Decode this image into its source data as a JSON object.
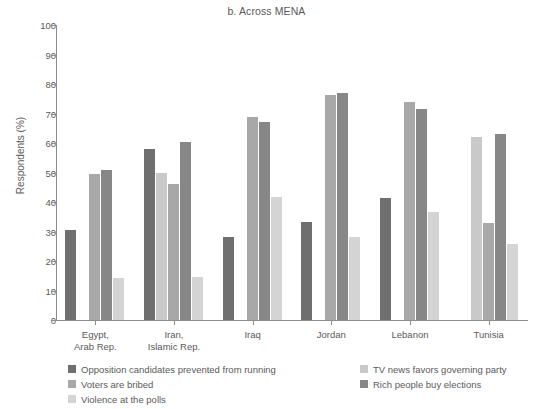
{
  "chart_data": {
    "type": "bar",
    "title": "b. Across MENA",
    "xlabel": "",
    "ylabel": "Respondents (%)",
    "ylim": [
      0,
      100
    ],
    "ytick_step": 10,
    "yticks": [
      0,
      10,
      20,
      30,
      40,
      50,
      60,
      70,
      80,
      90,
      100
    ],
    "grid": false,
    "legend_position": "bottom",
    "categories": [
      "Egypt, Arab Rep.",
      "Iran, Islamic Rep.",
      "Iraq",
      "Jordan",
      "Lebanon",
      "Tunisia"
    ],
    "category_lines": [
      [
        "Egypt,",
        "Arab Rep."
      ],
      [
        "Iran,",
        "Islamic Rep."
      ],
      [
        "Iraq",
        ""
      ],
      [
        "Jordan",
        ""
      ],
      [
        "Lebanon",
        ""
      ],
      [
        "Tunisia",
        ""
      ]
    ],
    "series": [
      {
        "name": "Opposition candidates prevented from running",
        "color": "#6f6f6f",
        "values": [
          30.4,
          58.0,
          28.0,
          33.2,
          41.4,
          null
        ]
      },
      {
        "name": "TV news favors governing party",
        "color": "#c9c9c9",
        "values": [
          null,
          49.8,
          null,
          null,
          null,
          62.0
        ]
      },
      {
        "name": "Voters are bribed",
        "color": "#a8a8a8",
        "values": [
          49.5,
          46.0,
          68.8,
          76.2,
          74.0,
          33.0
        ]
      },
      {
        "name": "Rich people buy elections",
        "color": "#878787",
        "values": [
          50.8,
          60.2,
          67.0,
          77.0,
          71.5,
          63.2
        ]
      },
      {
        "name": "Violence at the polls",
        "color": "#d4d4d4",
        "values": [
          14.4,
          14.6,
          41.7,
          28.0,
          36.5,
          25.8
        ]
      }
    ]
  },
  "legend": {
    "left_column": [
      {
        "label": "Opposition candidates prevented from running",
        "color": "#6f6f6f"
      },
      {
        "label": "Voters are bribed",
        "color": "#a8a8a8"
      },
      {
        "label": "Violence at the polls",
        "color": "#d4d4d4"
      }
    ],
    "right_column": [
      {
        "label": "TV news favors governing party",
        "color": "#c9c9c9"
      },
      {
        "label": "Rich people buy elections",
        "color": "#878787"
      }
    ]
  },
  "axis": {
    "y_title": "Respondents (%)",
    "y_labels": [
      "100",
      "90",
      "80",
      "70",
      "60",
      "50",
      "40",
      "30",
      "20",
      "10",
      "0"
    ]
  }
}
